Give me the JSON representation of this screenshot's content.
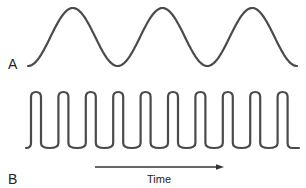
{
  "figure": {
    "panels": [
      {
        "label": "A",
        "waveform": "sine",
        "cycles_shown": 3,
        "description": "Low-frequency sinusoidal wave"
      },
      {
        "label": "B",
        "waveform": "high-frequency wave",
        "cycles_shown": 10,
        "description": "High-frequency wave with narrow rounded peaks"
      }
    ],
    "axis": {
      "label": "Time",
      "direction": "left-to-right arrow"
    },
    "colors": {
      "stroke": "#4a4a4a",
      "text": "#222222",
      "background": "#ffffff"
    }
  }
}
